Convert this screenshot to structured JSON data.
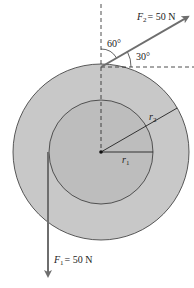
{
  "diagram": {
    "colors": {
      "outer_disk": "#c8c8c8",
      "inner_disk": "#bdbdbd",
      "force_arrow": "#6e6e6e",
      "line": "#222222",
      "background": "#ffffff"
    },
    "forces": [
      {
        "symbol": "F",
        "subscript": "2",
        "value_text": "= 50 N",
        "angle_from_vertical": "60°",
        "angle_from_horizontal": "30°"
      },
      {
        "symbol": "F",
        "subscript": "1",
        "value_text": "= 50 N",
        "direction": "down"
      }
    ],
    "radii": [
      {
        "symbol": "r",
        "subscript": "1"
      },
      {
        "symbol": "r",
        "subscript": "2"
      }
    ],
    "angles": {
      "a60": "60°",
      "a30": "30°"
    }
  }
}
